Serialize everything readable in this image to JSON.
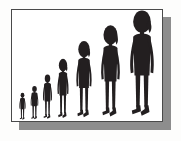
{
  "illustration": {
    "title": "Human figure growth progression",
    "description": "Seven brush-drawn human silhouettes arranged left to right in increasing height, suggesting growth or evolution",
    "frame": {
      "background_color": "#ffffff",
      "border_color": "#4a4a4a",
      "shadow_color": "#8d8d8d",
      "page_background_color": "#fdfdfc",
      "shadow_offset_x": 8,
      "shadow_offset_y": 8
    },
    "ink_color": "#231f20",
    "figure_count": 7,
    "figures": [
      {
        "index": 1,
        "name": "figure-smallest",
        "label": "Figure 1",
        "left": 6,
        "width": 9,
        "height": 29,
        "hair": "short",
        "relative_scale": 0.21
      },
      {
        "index": 2,
        "name": "figure-2",
        "label": "Figure 2",
        "left": 17,
        "width": 11,
        "height": 36,
        "hair": "short",
        "relative_scale": 0.27
      },
      {
        "index": 3,
        "name": "figure-3",
        "label": "Figure 3",
        "left": 29,
        "width": 13,
        "height": 48,
        "hair": "short",
        "relative_scale": 0.36
      },
      {
        "index": 4,
        "name": "figure-4",
        "label": "Figure 4",
        "left": 43,
        "width": 16,
        "height": 63,
        "hair": "long",
        "relative_scale": 0.47
      },
      {
        "index": 5,
        "name": "figure-5",
        "label": "Figure 5",
        "left": 61,
        "width": 22,
        "height": 81,
        "hair": "long",
        "relative_scale": 0.61
      },
      {
        "index": 6,
        "name": "figure-6",
        "label": "Figure 6",
        "left": 85,
        "width": 27,
        "height": 97,
        "hair": "long",
        "relative_scale": 0.73
      },
      {
        "index": 7,
        "name": "figure-largest",
        "label": "Figure 7",
        "left": 113,
        "width": 34,
        "height": 112,
        "hair": "long",
        "relative_scale": 1.0
      }
    ]
  }
}
